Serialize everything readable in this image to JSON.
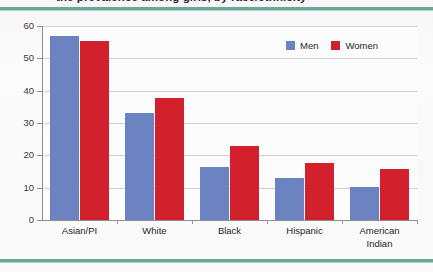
{
  "page": {
    "title_partial": "the prevalence among girls, by race/ethnicity",
    "rule_color": "#6aa79b",
    "background": "#fbfafa"
  },
  "legend": {
    "position": "top-right",
    "items": [
      {
        "label": "Men",
        "color": "#6b83c1"
      },
      {
        "label": "Women",
        "color": "#d2202c"
      }
    ]
  },
  "chart_data": {
    "type": "bar",
    "title": "",
    "xlabel": "",
    "ylabel": "",
    "ylim": [
      0,
      60
    ],
    "yticks": [
      0,
      10,
      20,
      30,
      40,
      50,
      60
    ],
    "grid": true,
    "categories": [
      "Asian/PI",
      "White",
      "Black",
      "Hispanic",
      "American Indian"
    ],
    "series": [
      {
        "name": "Men",
        "color": "#6b83c1",
        "values": [
          57.0,
          33.0,
          16.5,
          13.0,
          10.3
        ]
      },
      {
        "name": "Women",
        "color": "#d2202c",
        "values": [
          55.5,
          37.7,
          23.0,
          17.5,
          15.8
        ]
      }
    ]
  }
}
